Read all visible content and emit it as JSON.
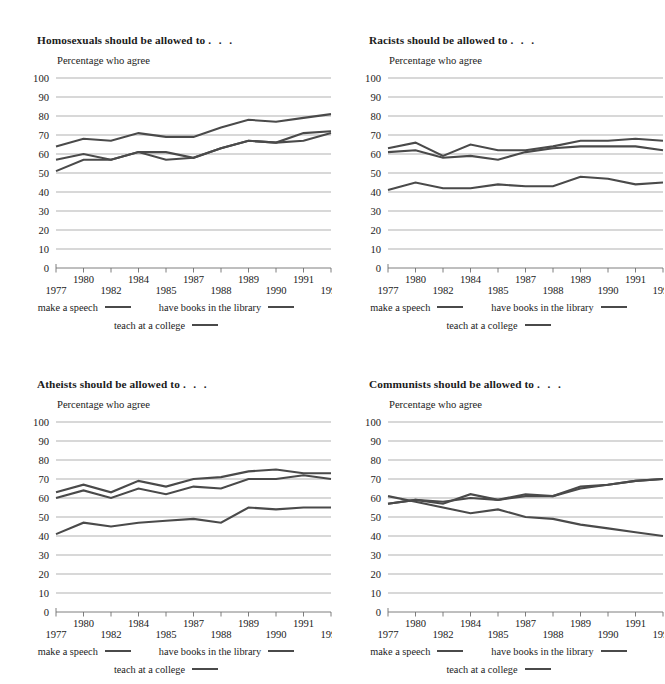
{
  "document": {
    "kind": "four-panel-line-chart-figure",
    "background": "#ffffff",
    "series_color": "#4a4a4a",
    "gridline_color": "#a8a8a8",
    "axis_color": "#6f6f6f",
    "text_color": "#1b1b1b"
  },
  "common": {
    "subtitle": "Percentage who agree",
    "title_suffix": ". . .",
    "legend": {
      "row1": [
        {
          "label": "make a speech",
          "swatch": "line-swatch"
        },
        {
          "label": "have books in the library",
          "swatch": "line-swatch"
        }
      ],
      "row2": [
        {
          "label": "teach at a college",
          "swatch": "line-swatch"
        }
      ]
    },
    "years": [
      1977,
      1980,
      1982,
      1984,
      1985,
      1987,
      1988,
      1989,
      1990,
      1991,
      1993
    ],
    "xtick_labels": [
      "1977",
      "1980",
      "1982",
      "1984",
      "1985",
      "1987",
      "1988",
      "1989",
      "1990",
      "1991",
      "1993"
    ],
    "xtick_label_rows": [
      "lower",
      "upper",
      "lower",
      "upper",
      "lower",
      "upper",
      "lower",
      "upper",
      "lower",
      "upper",
      "lower"
    ],
    "ytick_labels": [
      "0",
      "10",
      "20",
      "30",
      "40",
      "50",
      "60",
      "70",
      "80",
      "90",
      "100"
    ],
    "ylim": [
      0,
      100
    ],
    "ystep": 10
  },
  "panels": [
    {
      "id": "homosexuals",
      "title": "Homosexuals should be allowed to",
      "chart_data": {
        "type": "line",
        "title": "Homosexuals should be allowed to . . .",
        "subtitle": "Percentage who agree",
        "xlabel": "",
        "ylabel": "Percentage who agree",
        "ylim": [
          0,
          100
        ],
        "grid": true,
        "legend_position": "bottom",
        "x": [
          1977,
          1980,
          1982,
          1984,
          1985,
          1987,
          1988,
          1989,
          1990,
          1991,
          1993
        ],
        "series": [
          {
            "name": "make a speech",
            "values": [
              64,
              68,
              67,
              71,
              69,
              69,
              74,
              78,
              77,
              79,
              81
            ]
          },
          {
            "name": "have books in the library",
            "values": [
              57,
              60,
              57,
              61,
              61,
              58,
              63,
              67,
              66,
              71,
              72
            ]
          },
          {
            "name": "teach at a college",
            "values": [
              51,
              57,
              57,
              61,
              57,
              58,
              63,
              67,
              66,
              67,
              71
            ]
          }
        ]
      }
    },
    {
      "id": "racists",
      "title": "Racists should be allowed to",
      "chart_data": {
        "type": "line",
        "title": "Racists should be allowed to . . .",
        "subtitle": "Percentage who agree",
        "xlabel": "",
        "ylabel": "Percentage who agree",
        "ylim": [
          0,
          100
        ],
        "grid": true,
        "legend_position": "bottom",
        "x": [
          1977,
          1980,
          1982,
          1984,
          1985,
          1987,
          1988,
          1989,
          1990,
          1991,
          1993
        ],
        "series": [
          {
            "name": "make a speech",
            "values": [
              63,
              66,
              59,
              65,
              62,
              62,
              64,
              67,
              67,
              68,
              67
            ]
          },
          {
            "name": "have books in the library",
            "values": [
              61,
              62,
              58,
              59,
              57,
              61,
              63,
              64,
              64,
              64,
              62
            ]
          },
          {
            "name": "teach at a college",
            "values": [
              41,
              45,
              42,
              42,
              44,
              43,
              43,
              48,
              47,
              44,
              45
            ]
          }
        ]
      }
    },
    {
      "id": "atheists",
      "title": "Atheists should be allowed to",
      "chart_data": {
        "type": "line",
        "title": "Atheists should be allowed to . . .",
        "subtitle": "Percentage who agree",
        "xlabel": "",
        "ylabel": "Percentage who agree",
        "ylim": [
          0,
          100
        ],
        "grid": true,
        "legend_position": "bottom",
        "x": [
          1977,
          1980,
          1982,
          1984,
          1985,
          1987,
          1988,
          1989,
          1990,
          1991,
          1993
        ],
        "series": [
          {
            "name": "make a speech",
            "values": [
              63,
              67,
              63,
              69,
              66,
              70,
              71,
              74,
              75,
              73,
              73
            ]
          },
          {
            "name": "have books in the library",
            "values": [
              60,
              64,
              60,
              65,
              62,
              66,
              65,
              70,
              70,
              72,
              70
            ]
          },
          {
            "name": "teach at a college",
            "values": [
              41,
              47,
              45,
              47,
              48,
              49,
              47,
              55,
              54,
              55,
              55
            ]
          }
        ]
      }
    },
    {
      "id": "communists",
      "title": "Communists should be allowed to",
      "chart_data": {
        "type": "line",
        "title": "Communists should be allowed to . . .",
        "subtitle": "Percentage who agree",
        "xlabel": "",
        "ylabel": "Percentage who agree",
        "ylim": [
          0,
          100
        ],
        "grid": true,
        "legend_position": "bottom",
        "x": [
          1977,
          1980,
          1982,
          1984,
          1985,
          1987,
          1988,
          1989,
          1990,
          1991,
          1993
        ],
        "series": [
          {
            "name": "make a speech",
            "values": [
              57,
              59,
              57,
              62,
              59,
              62,
              61,
              66,
              67,
              69,
              70
            ]
          },
          {
            "name": "have books in the library",
            "values": [
              57,
              59,
              58,
              60,
              59,
              61,
              61,
              65,
              67,
              69,
              70
            ]
          },
          {
            "name": "teach at a college",
            "values": [
              61,
              58,
              55,
              52,
              54,
              50,
              49,
              46,
              44,
              42,
              40
            ]
          }
        ]
      }
    }
  ]
}
